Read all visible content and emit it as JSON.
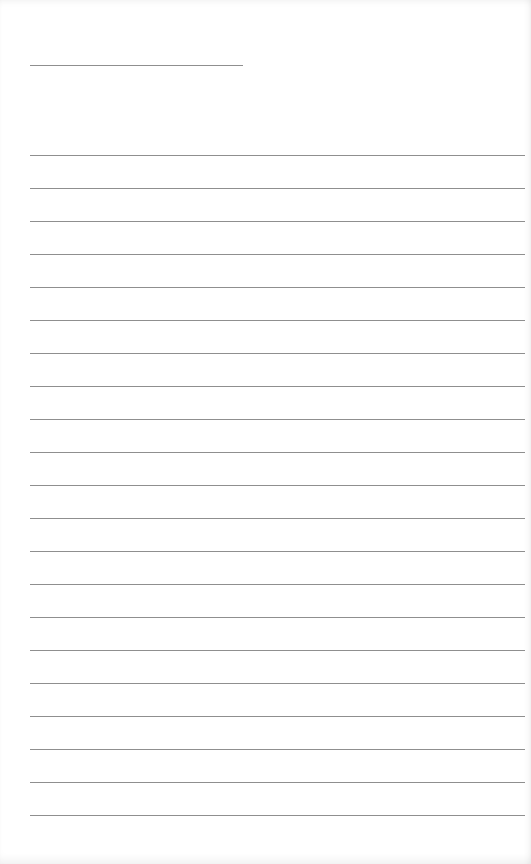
{
  "page": {
    "type": "lined-writing-sheet",
    "background_color": "#ffffff",
    "line_color": "#8f8f8f"
  },
  "header": {
    "name_line": {
      "x": 30,
      "y": 65,
      "width": 213,
      "text": ""
    }
  },
  "body": {
    "first_line_y": 155,
    "line_spacing": 33,
    "line_left": 30,
    "line_width": 495,
    "lines": [
      "",
      "",
      "",
      "",
      "",
      "",
      "",
      "",
      "",
      "",
      "",
      "",
      "",
      "",
      "",
      "",
      "",
      "",
      "",
      "",
      ""
    ]
  }
}
